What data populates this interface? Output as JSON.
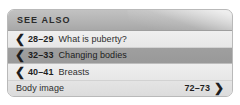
{
  "box": {
    "header_label": "SEE ALSO",
    "accent_color": "#b4b4b4",
    "highlight_row_color": "#9f9f9f",
    "text_color": "#2e2e2e"
  },
  "rows": [
    {
      "chevron": "chevron-left-icon",
      "chevron_glyph": "❮",
      "pages": "28–29",
      "title": "What is puberty?",
      "tone": "light"
    },
    {
      "chevron": "chevron-left-icon",
      "chevron_glyph": "❮",
      "pages": "32–33",
      "title": "Changing bodies",
      "tone": "dark"
    },
    {
      "chevron": "chevron-left-icon",
      "chevron_glyph": "❮",
      "pages": "40–41",
      "title": "Breasts",
      "tone": "light"
    },
    {
      "chevron": "chevron-right-icon",
      "chevron_glyph": "❯",
      "pages": "72–73",
      "title": "Body image",
      "tone": "pale"
    }
  ]
}
